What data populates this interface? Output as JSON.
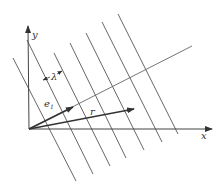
{
  "diagram": {
    "colors": {
      "line": "#555555",
      "axis": "#444444",
      "vector": "#333333",
      "background": "#ffffff"
    },
    "axes": {
      "origin": [
        29,
        129
      ],
      "x": {
        "label": "x",
        "end": [
          212,
          129
        ],
        "label_pos": [
          201,
          139
        ]
      },
      "y": {
        "label": "y",
        "end": [
          28,
          26
        ],
        "label_pos": [
          32,
          38
        ]
      }
    },
    "normal_line": {
      "from": [
        29,
        129
      ],
      "to": [
        192,
        46
      ]
    },
    "wavefronts": [
      {
        "from": [
          13,
          58
        ],
        "to": [
          76,
          181
        ]
      },
      {
        "from": [
          27,
          40
        ],
        "to": [
          93,
          174
        ]
      },
      {
        "from": [
          54,
          53
        ],
        "to": [
          110,
          166
        ]
      },
      {
        "from": [
          70,
          43
        ],
        "to": [
          126,
          158
        ]
      },
      {
        "from": [
          86,
          33
        ],
        "to": [
          144,
          150
        ]
      },
      {
        "from": [
          102,
          22
        ],
        "to": [
          162,
          142
        ]
      },
      {
        "from": [
          118,
          14
        ],
        "to": [
          178,
          134
        ]
      }
    ],
    "vectors": [
      {
        "name": "e1",
        "label": "e",
        "subscript": "1",
        "from": [
          29,
          129
        ],
        "to": [
          73,
          107
        ],
        "label_pos": [
          44,
          107
        ]
      },
      {
        "name": "r",
        "label": "r",
        "from": [
          29,
          129
        ],
        "to": [
          134,
          109
        ],
        "label_pos": [
          90,
          115
        ]
      }
    ],
    "wavelength": {
      "label": "λ",
      "label_pos": [
        51,
        80
      ],
      "left_tip": [
        43,
        80
      ],
      "right_tip": [
        62,
        71
      ]
    }
  }
}
